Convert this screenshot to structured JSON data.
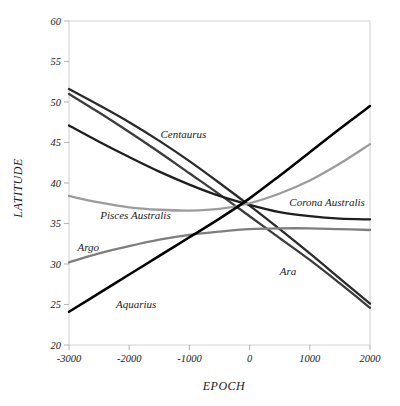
{
  "chart_data": {
    "type": "line",
    "title": "",
    "xlabel": "EPOCH",
    "ylabel": "LATITUDE",
    "xlim": [
      -3000,
      2000
    ],
    "ylim": [
      20,
      60
    ],
    "xticks": [
      "-3000",
      "-2000",
      "-1000",
      "0",
      "1000",
      "2000"
    ],
    "xtick_values": [
      -3000,
      -2000,
      -1000,
      0,
      1000,
      2000
    ],
    "yticks": [
      "20",
      "25",
      "30",
      "35",
      "40",
      "45",
      "50",
      "55",
      "60"
    ],
    "ytick_values": [
      20,
      25,
      30,
      35,
      40,
      45,
      50,
      55,
      60
    ],
    "grid": false,
    "legend_position": "inline-labels",
    "x": [
      -3000,
      -2500,
      -2000,
      -1500,
      -1000,
      -500,
      0,
      500,
      1000,
      1500,
      2000
    ],
    "series": [
      {
        "name": "Centaurus",
        "color": "#2a2a2a",
        "width": 2.3,
        "values": [
          51.6,
          49.6,
          47.5,
          45.2,
          42.7,
          40.0,
          37.2,
          34.3,
          31.3,
          28.2,
          25.1
        ],
        "label_x": -1480,
        "label_y": 45.6
      },
      {
        "name": "Ara",
        "color": "#3c3c3c",
        "width": 2.3,
        "values": [
          51.0,
          48.7,
          46.3,
          43.8,
          41.2,
          38.6,
          35.9,
          33.2,
          30.5,
          27.6,
          24.6
        ],
        "label_x": 500,
        "label_y": 28.6
      },
      {
        "name": "Corona Australis",
        "color": "#1f1f1f",
        "width": 2.3,
        "values": [
          47.1,
          45.1,
          43.2,
          41.4,
          39.8,
          38.4,
          37.3,
          36.4,
          35.9,
          35.6,
          35.5
        ],
        "label_x": 660,
        "label_y": 37.2
      },
      {
        "name": "Pisces Australis",
        "color": "#9c9c9c",
        "width": 2.3,
        "values": [
          38.4,
          37.6,
          37.0,
          36.7,
          36.6,
          36.8,
          37.5,
          38.7,
          40.3,
          42.4,
          44.8
        ],
        "label_x": -2480,
        "label_y": 35.5
      },
      {
        "name": "Argo",
        "color": "#7e7e7e",
        "width": 2.3,
        "values": [
          30.2,
          31.3,
          32.2,
          33.0,
          33.6,
          34.0,
          34.3,
          34.4,
          34.4,
          34.3,
          34.2
        ],
        "label_x": -2860,
        "label_y": 31.6
      },
      {
        "name": "Aquarius",
        "color": "#000000",
        "width": 2.5,
        "values": [
          24.1,
          26.4,
          28.7,
          31.0,
          33.3,
          35.6,
          38.1,
          40.9,
          43.8,
          46.7,
          49.5
        ],
        "label_x": -2220,
        "label_y": 24.6
      }
    ]
  },
  "axes": {
    "x_title": "EPOCH",
    "y_title": "LATITUDE"
  }
}
